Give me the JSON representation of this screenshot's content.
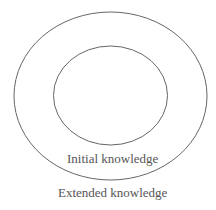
{
  "diagram": {
    "type": "nested-ellipses",
    "outer": {
      "label": "Extended knowledge",
      "stroke": "#666666"
    },
    "inner": {
      "label": "Initial knowledge",
      "stroke": "#666666"
    }
  }
}
